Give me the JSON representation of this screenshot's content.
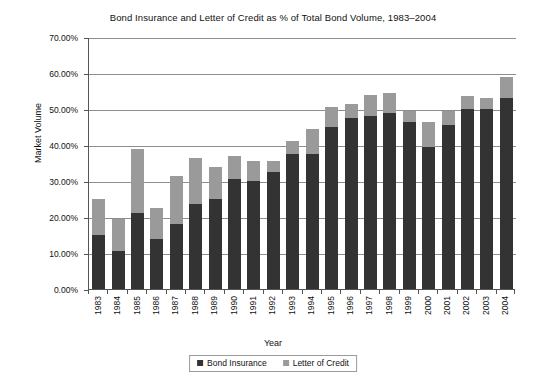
{
  "chart_data": {
    "type": "bar",
    "title": "Bond Insurance and Letter of Credit as % of Total Bond Volume, 1983–2004",
    "xlabel": "Year",
    "ylabel": "Market Volume",
    "ylim": [
      0,
      70
    ],
    "ytick_labels": [
      "70.00%",
      "60.00%",
      "50.00%",
      "40.00%",
      "30.00%",
      "20.00%",
      "10.00%",
      "0.00%"
    ],
    "ytick_values": [
      70,
      60,
      50,
      40,
      30,
      20,
      10,
      0
    ],
    "grid": true,
    "stacked": true,
    "legend_position": "bottom",
    "categories": [
      "1983",
      "1984",
      "1985",
      "1986",
      "1987",
      "1988",
      "1989",
      "1990",
      "1991",
      "1992",
      "1993",
      "1994",
      "1995",
      "1996",
      "1997",
      "1998",
      "1999",
      "2000",
      "2001",
      "2002",
      "2003",
      "2004"
    ],
    "series": [
      {
        "name": "Bond Insurance",
        "color": "#333333",
        "values": [
          15.0,
          10.5,
          21.0,
          14.0,
          18.0,
          23.5,
          25.0,
          30.5,
          30.0,
          32.5,
          37.5,
          37.5,
          45.0,
          47.5,
          48.0,
          49.0,
          46.5,
          39.5,
          45.5,
          50.0,
          50.0,
          53.0
        ]
      },
      {
        "name": "Letter of Credit",
        "color": "#9a9a9a",
        "values": [
          10.0,
          9.0,
          18.0,
          8.5,
          13.5,
          13.0,
          9.0,
          6.5,
          5.5,
          3.0,
          3.5,
          7.0,
          5.5,
          4.0,
          6.0,
          5.5,
          3.0,
          7.0,
          4.0,
          3.5,
          3.0,
          6.0
        ]
      }
    ],
    "totals": [
      25.0,
      19.5,
      39.0,
      22.5,
      31.5,
      36.5,
      34.0,
      37.0,
      35.5,
      35.5,
      41.0,
      44.5,
      50.5,
      51.5,
      54.0,
      54.5,
      49.5,
      46.5,
      49.5,
      53.5,
      53.0,
      59.0
    ]
  }
}
